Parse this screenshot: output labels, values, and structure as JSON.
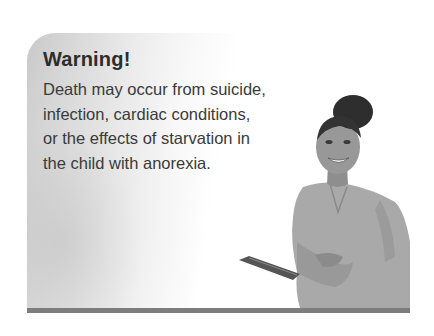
{
  "warning_card": {
    "title": "Warning!",
    "body_lines": [
      "Death may occur from suicide,",
      "infection, cardiac conditions,",
      "or the effects of starvation in",
      "the child with anorexia."
    ],
    "illustration": "nurse-holding-tablet-photo",
    "colors": {
      "title": "#2d2d2d",
      "text": "#3a3a3a",
      "bottom_bar": "#7d7d7d",
      "gradient_left": "#c9c9c9"
    }
  }
}
